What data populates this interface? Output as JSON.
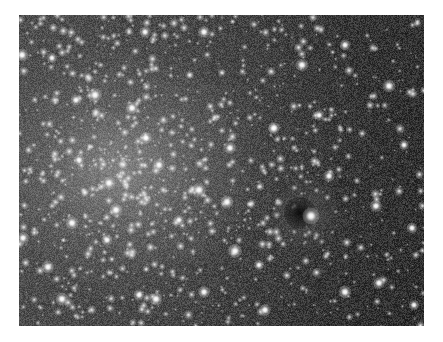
{
  "image": {
    "subject": "globular star cluster field",
    "frame": {
      "x": 19,
      "y": 15,
      "width": 405,
      "height": 311
    },
    "border_color": "#ffffff",
    "core_center": {
      "x": 101,
      "y": 155
    },
    "colors": {
      "background_dark": "#151515",
      "background_mid": "#2c2c2c",
      "core_glow": "#969696",
      "star": "#ffffff"
    }
  },
  "features": {
    "dark_spot": {
      "x": 281,
      "y": 198,
      "r": 16
    },
    "halo": {
      "x": 287,
      "y": 199,
      "r": 34
    }
  },
  "bright_stars": [
    {
      "x": 292,
      "y": 201,
      "r": 3.4
    },
    {
      "x": 283,
      "y": 50,
      "r": 2.6
    },
    {
      "x": 326,
      "y": 30,
      "r": 2.2
    },
    {
      "x": 370,
      "y": 71,
      "r": 2.6
    },
    {
      "x": 255,
      "y": 113,
      "r": 2.4
    },
    {
      "x": 211,
      "y": 133,
      "r": 2.4
    },
    {
      "x": 208,
      "y": 187,
      "r": 2.6
    },
    {
      "x": 216,
      "y": 236,
      "r": 2.8
    },
    {
      "x": 357,
      "y": 191,
      "r": 2.4
    },
    {
      "x": 326,
      "y": 277,
      "r": 2.6
    },
    {
      "x": 360,
      "y": 268,
      "r": 2.4
    },
    {
      "x": 310,
      "y": 161,
      "r": 2.2
    },
    {
      "x": 246,
      "y": 295,
      "r": 2.4
    },
    {
      "x": 393,
      "y": 213,
      "r": 2.2
    },
    {
      "x": 180,
      "y": 175,
      "r": 2.8
    },
    {
      "x": 90,
      "y": 168,
      "r": 2.6
    },
    {
      "x": 53,
      "y": 208,
      "r": 2.6
    },
    {
      "x": 4,
      "y": 223,
      "r": 2.4
    },
    {
      "x": 29,
      "y": 252,
      "r": 2.6
    },
    {
      "x": 43,
      "y": 284,
      "r": 2.6
    },
    {
      "x": 137,
      "y": 284,
      "r": 2.6
    },
    {
      "x": 120,
      "y": 280,
      "r": 2.2
    },
    {
      "x": 88,
      "y": 225,
      "r": 2.2
    },
    {
      "x": 97,
      "y": 195,
      "r": 2.6
    },
    {
      "x": 185,
      "y": 277,
      "r": 2.4
    },
    {
      "x": 3,
      "y": 40,
      "r": 2.6
    },
    {
      "x": 76,
      "y": 80,
      "r": 2.8
    },
    {
      "x": 57,
      "y": 85,
      "r": 2.2
    },
    {
      "x": 113,
      "y": 93,
      "r": 2.6
    },
    {
      "x": 126,
      "y": 17,
      "r": 2.2
    },
    {
      "x": 185,
      "y": 17,
      "r": 2.4
    },
    {
      "x": 127,
      "y": 123,
      "r": 2.4
    },
    {
      "x": 33,
      "y": 43,
      "r": 2.0
    },
    {
      "x": 60,
      "y": 145,
      "r": 2.2
    },
    {
      "x": 140,
      "y": 150,
      "r": 2.4
    },
    {
      "x": 160,
      "y": 205,
      "r": 2.0
    },
    {
      "x": 385,
      "y": 130,
      "r": 2.0
    },
    {
      "x": 395,
      "y": 290,
      "r": 2.0
    },
    {
      "x": 240,
      "y": 250,
      "r": 2.0
    },
    {
      "x": 300,
      "y": 100,
      "r": 1.9
    }
  ],
  "field_stars": {
    "count": 1400,
    "seed": 12345
  }
}
